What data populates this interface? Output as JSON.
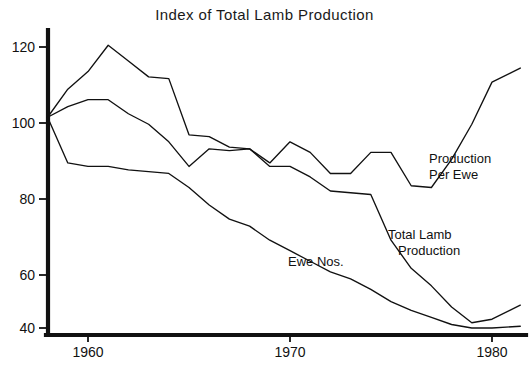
{
  "chart_data": {
    "type": "line",
    "title": "Index of Total Lamb Production",
    "xlabel": "",
    "ylabel": "",
    "xlim": [
      1958,
      1981.4
    ],
    "ylim": [
      36,
      126
    ],
    "grid": false,
    "legend_position": "inline-annotations",
    "xticks": [
      1960,
      1970,
      1980
    ],
    "xtick_labels": [
      "1960",
      "1970",
      "1980"
    ],
    "yticks": [
      40,
      60,
      80,
      100,
      120
    ],
    "ytick_labels": [
      "40",
      "60",
      "80",
      "100",
      "120"
    ],
    "series": [
      {
        "name": "Production Per Ewe",
        "label": "Production\nPer Ewe",
        "label_line_1": "Production",
        "label_line_2": "Per Ewe",
        "x": [
          1958,
          1959,
          1960,
          1961,
          1962,
          1963,
          1964,
          1965,
          1966,
          1967,
          1968,
          1969,
          1970,
          1971,
          1972,
          1973,
          1974,
          1975,
          1976,
          1977,
          1978,
          1979,
          1980,
          1981.4
        ],
        "values": [
          100,
          108,
          113,
          120.5,
          116,
          111.5,
          111,
          95,
          94.5,
          91.5,
          91,
          87,
          93,
          90,
          84,
          84,
          90,
          90,
          80.5,
          80,
          88,
          98,
          110,
          114
        ]
      },
      {
        "name": "Total Lamb Production",
        "label": "Total Lamb\nProduction",
        "label_line_1": "Total Lamb",
        "label_line_2": "Production",
        "x": [
          1958,
          1959,
          1960,
          1961,
          1962,
          1963,
          1964,
          1965,
          1966,
          1967,
          1968,
          1969,
          1970,
          1971,
          1972,
          1973,
          1974,
          1975,
          1976,
          1977,
          1978,
          1979,
          1980,
          1981.4
        ],
        "values": [
          100,
          103,
          105,
          105,
          101,
          98,
          93,
          86,
          91,
          90.5,
          91,
          86,
          86,
          83,
          79,
          78.5,
          78,
          65,
          57,
          52,
          46,
          41.5,
          42.5,
          46.5
        ],
        "peak_note": "local recovery near 1966"
      },
      {
        "name": "Ewe Nos.",
        "label": "Ewe Nos.",
        "x": [
          1958,
          1959,
          1960,
          1961,
          1962,
          1963,
          1964,
          1965,
          1966,
          1967,
          1968,
          1969,
          1970,
          1971,
          1972,
          1973,
          1974,
          1975,
          1976,
          1977,
          1978,
          1979,
          1980,
          1981.4
        ],
        "values": [
          100,
          87,
          86,
          86,
          85,
          84.5,
          84,
          80,
          75,
          71,
          69,
          65,
          62,
          59,
          56,
          54,
          51,
          47.5,
          45,
          43,
          41,
          40,
          40,
          40.5
        ]
      }
    ],
    "annotations": [
      {
        "text": "Production Per Ewe",
        "x": 1979.2,
        "y": 86
      },
      {
        "text": "Total Lamb Production",
        "x": 1976.6,
        "y": 64
      },
      {
        "text": "Ewe Nos.",
        "x": 1969.1,
        "y": 52
      }
    ]
  },
  "colors": {
    "line": "#111111",
    "axis": "#111111",
    "background": "#ffffff",
    "text": "#1a1a1a"
  }
}
